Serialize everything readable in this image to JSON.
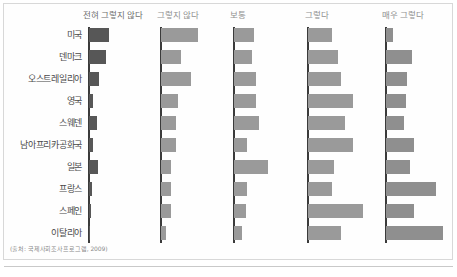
{
  "figure": {
    "source_note": "(출처: 국제사회조사프로그램, 2009)",
    "frame_color": "#d8d8d8",
    "axis_color": "#3b3b3b"
  },
  "chart_data": {
    "type": "bar",
    "title": "",
    "subtitle": "",
    "xlabel": "",
    "ylabel": "",
    "orientation": "horizontal",
    "layout": "small-multiples",
    "grid": false,
    "legend_position": "top",
    "xlim": [
      0,
      60
    ],
    "categories": [
      "미국",
      "덴마크",
      "오스트레일리아",
      "영국",
      "스웨덴",
      "남아프리카공화국",
      "일본",
      "프랑스",
      "스페인",
      "이탈리아"
    ],
    "series": [
      {
        "name": "전혀 그렇지 않다",
        "color": "#575757",
        "values": [
          20,
          17,
          10,
          4,
          8,
          4,
          9,
          3,
          2,
          1
        ]
      },
      {
        "name": "그렇지 않다",
        "color": "#9a9a9a",
        "values": [
          37,
          20,
          30,
          17,
          15,
          15,
          10,
          10,
          10,
          5
        ]
      },
      {
        "name": "보통",
        "color": "#9a9a9a",
        "values": [
          20,
          18,
          22,
          22,
          25,
          13,
          34,
          13,
          12,
          8
        ]
      },
      {
        "name": "그렇다",
        "color": "#9a9a9a",
        "values": [
          24,
          30,
          33,
          45,
          37,
          45,
          26,
          24,
          55,
          33
        ]
      },
      {
        "name": "매우 그렇다",
        "color": "#8f8f8f",
        "values": [
          7,
          26,
          21,
          20,
          18,
          28,
          24,
          50,
          28,
          57
        ]
      }
    ],
    "panel_left_positions": [
      88,
      160,
      233,
      307,
      385
    ],
    "panel_header_positions": [
      83,
      157,
      230,
      305,
      382
    ]
  }
}
